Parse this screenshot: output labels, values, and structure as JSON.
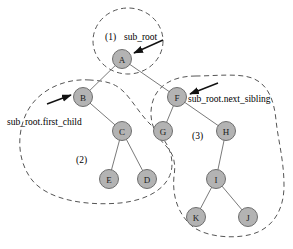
{
  "figure": {
    "background_color": "#ffffff",
    "node_fill": "#b3b3b3",
    "node_stroke": "#6e6e6e",
    "edge_color": "#7a7a7a",
    "outline_color": "#555555",
    "pointer_color": "#111111"
  },
  "nodes": [
    {
      "id": "A",
      "label": "A",
      "cx": 122,
      "cy": 59,
      "r": 9.5
    },
    {
      "id": "B",
      "label": "B",
      "cx": 83,
      "cy": 97,
      "r": 9.5
    },
    {
      "id": "C",
      "label": "C",
      "cx": 122,
      "cy": 131,
      "r": 9.5
    },
    {
      "id": "E",
      "label": "E",
      "cx": 109,
      "cy": 179,
      "r": 9.5
    },
    {
      "id": "D",
      "label": "D",
      "cx": 147,
      "cy": 179,
      "r": 9.5
    },
    {
      "id": "F",
      "label": "F",
      "cx": 177,
      "cy": 97,
      "r": 9.5
    },
    {
      "id": "G",
      "label": "G",
      "cx": 163,
      "cy": 131,
      "r": 9.5
    },
    {
      "id": "H",
      "label": "H",
      "cx": 226,
      "cy": 131,
      "r": 9.5
    },
    {
      "id": "I",
      "label": "I",
      "cx": 216,
      "cy": 179,
      "r": 9.5
    },
    {
      "id": "K",
      "label": "K",
      "cx": 196,
      "cy": 217,
      "r": 9.5
    },
    {
      "id": "J",
      "label": "J",
      "cx": 248,
      "cy": 217,
      "r": 9.5
    }
  ],
  "edges": [
    {
      "from": "A",
      "to": "B"
    },
    {
      "from": "A",
      "to": "F"
    },
    {
      "from": "B",
      "to": "C"
    },
    {
      "from": "C",
      "to": "E"
    },
    {
      "from": "C",
      "to": "D"
    },
    {
      "from": "F",
      "to": "G"
    },
    {
      "from": "F",
      "to": "H"
    },
    {
      "from": "H",
      "to": "I"
    },
    {
      "from": "I",
      "to": "K"
    },
    {
      "from": "I",
      "to": "J"
    }
  ],
  "groups": [
    {
      "id": "group-1",
      "tag": "(1)",
      "tag_x": 105,
      "tag_y": 37,
      "encloses": [
        "A"
      ]
    },
    {
      "id": "group-2",
      "tag": "(2)",
      "tag_x": 76,
      "tag_y": 160,
      "encloses": [
        "B",
        "C",
        "E",
        "D"
      ]
    },
    {
      "id": "group-3",
      "tag": "(3)",
      "tag_x": 192,
      "tag_y": 136,
      "encloses": [
        "F",
        "G",
        "H",
        "I",
        "K",
        "J"
      ]
    }
  ],
  "annotations": [
    {
      "id": "sub-root",
      "text": "sub_root",
      "text_x": 124,
      "text_y": 40,
      "target": "A"
    },
    {
      "id": "sub-root-first-child",
      "text": "sub_root.first_child",
      "text_x": 7,
      "text_y": 122,
      "target": "B"
    },
    {
      "id": "sub-root-next-sibling",
      "text": "sub_root.next_sibling",
      "text_x": 188,
      "text_y": 102,
      "target": "F"
    }
  ]
}
